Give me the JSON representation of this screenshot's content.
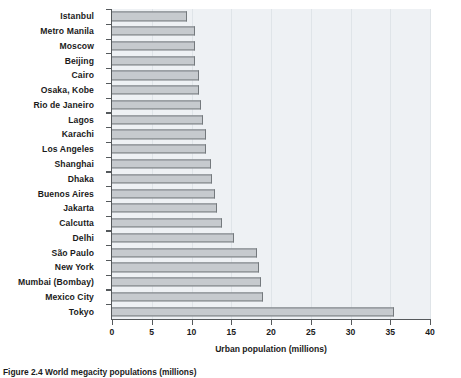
{
  "chart_data": {
    "type": "bar",
    "orientation": "horizontal",
    "title": "",
    "xlabel": "Urban population (millions)",
    "ylabel": "",
    "xlim": [
      0,
      40
    ],
    "xticks": [
      0,
      5,
      10,
      15,
      20,
      25,
      30,
      35,
      40
    ],
    "grid": true,
    "grid_axis": "x",
    "legend": false,
    "categories": [
      "Istanbul",
      "Metro Manila",
      "Moscow",
      "Beijing",
      "Cairo",
      "Osaka, Kobe",
      "Rio de Janeiro",
      "Lagos",
      "Karachi",
      "Los Angeles",
      "Shanghai",
      "Dhaka",
      "Buenos Aires",
      "Jakarta",
      "Calcutta",
      "Delhi",
      "São Paulo",
      "New York",
      "Mumbai (Bombay)",
      "Mexico City",
      "Tokyo"
    ],
    "values": [
      9.4,
      10.4,
      10.5,
      10.5,
      10.9,
      11.0,
      11.2,
      11.4,
      11.8,
      11.8,
      12.4,
      12.6,
      13.0,
      13.2,
      13.8,
      15.3,
      18.3,
      18.5,
      18.7,
      19.0,
      35.5
    ],
    "colors": {
      "bar_fill": "#c6cace",
      "bar_edge": "#74797d",
      "panel_background": "#eef1f4",
      "gridline": "#dfe4e8",
      "axis": "#55595c",
      "text": "#1b1b1b"
    }
  },
  "caption": {
    "text": "Figure 2.4 World megacity populations (millions)"
  }
}
